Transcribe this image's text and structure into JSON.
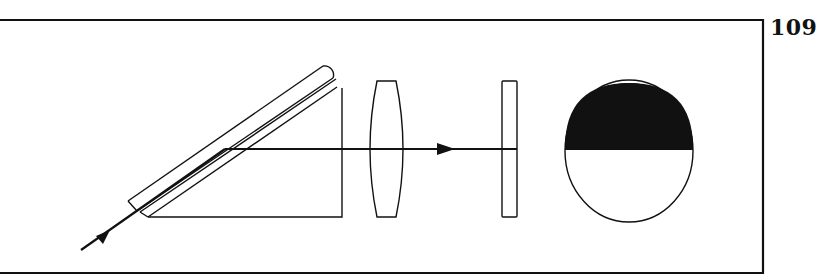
{
  "page": {
    "number": "109"
  },
  "figure": {
    "components": [
      {
        "name": "incident-ray",
        "type": "arrow",
        "direction": "up-right"
      },
      {
        "name": "prism",
        "type": "right-triangle-prism-with-slab"
      },
      {
        "name": "lens",
        "type": "biconvex-lens"
      },
      {
        "name": "plate",
        "type": "thin-plate"
      },
      {
        "name": "field-of-view",
        "type": "circle",
        "top_half": "dark",
        "bottom_half": "light"
      }
    ],
    "colors": {
      "ink": "#111111",
      "paper": "#ffffff"
    }
  }
}
